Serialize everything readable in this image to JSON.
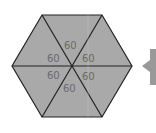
{
  "diagram": {
    "shape": "regular-hexagon",
    "fill_color": "#a9a9a9",
    "stroke_color": "#222222",
    "label_color": "#6a6a6a",
    "angle_labels": [
      {
        "text": "60",
        "x": 71,
        "y": 48
      },
      {
        "text": "60",
        "x": 55,
        "y": 62
      },
      {
        "text": "60",
        "x": 88,
        "y": 62
      },
      {
        "text": "60",
        "x": 54,
        "y": 78
      },
      {
        "text": "60",
        "x": 88,
        "y": 79
      },
      {
        "text": "60",
        "x": 70,
        "y": 91
      }
    ],
    "pointer_color": "#999999"
  }
}
